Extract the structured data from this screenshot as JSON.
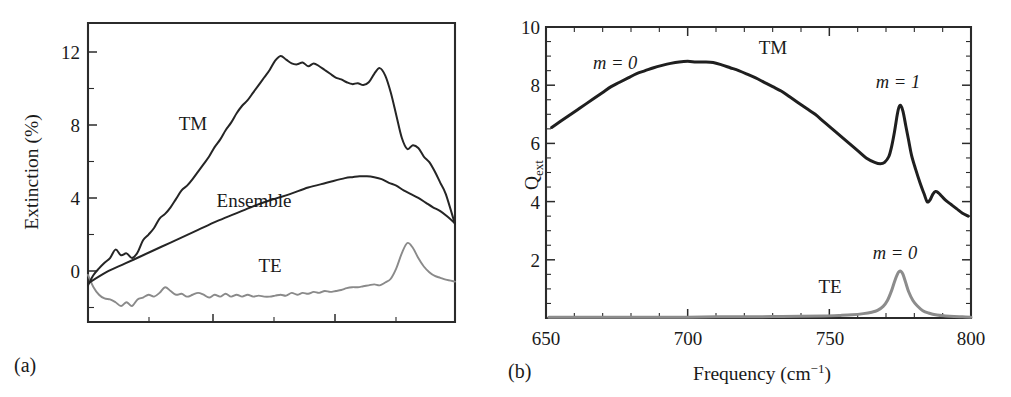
{
  "figure": {
    "background": "#ffffff",
    "panel_tags": [
      "(a)",
      "(b)"
    ]
  },
  "chart_data": [
    {
      "type": "line",
      "panel": "(a)",
      "title": "",
      "xlabel": "",
      "ylabel": "Extinction (%)",
      "xlim": [
        0,
        100
      ],
      "ylim": [
        -2.4,
        13.5
      ],
      "yticks": [
        0,
        4,
        8,
        12
      ],
      "ytick_minor": [
        2,
        6,
        10
      ],
      "xticks_unlabeled": [
        34,
        68
      ],
      "grid": false,
      "legend": "inline-annotations",
      "annotations": [
        {
          "text": "TM",
          "x": 26,
          "y": 7.6
        },
        {
          "text": "Ensemble",
          "x": 37,
          "y": 4.0
        },
        {
          "text": "TE",
          "x": 53,
          "y": 0.35
        }
      ],
      "series": [
        {
          "name": "TM",
          "color": "#252525",
          "x": [
            0,
            1.5,
            3,
            4.5,
            6,
            7.5,
            9,
            10.5,
            12,
            13.5,
            15,
            16.5,
            18,
            19.5,
            21,
            22.5,
            24,
            25.5,
            27,
            28.5,
            30,
            31.5,
            33,
            34.5,
            36,
            37.5,
            39,
            40.5,
            42,
            43.5,
            45,
            46.5,
            48,
            49.5,
            51,
            52.5,
            54,
            55.5,
            57,
            58.5,
            60,
            61.5,
            63,
            64.5,
            66,
            67.5,
            69,
            70.5,
            72,
            73.5,
            75,
            76.5,
            78,
            79.5,
            81,
            82.5,
            84,
            85.5,
            87,
            88.5,
            90,
            91.5,
            93,
            94.5,
            96,
            97.5,
            100
          ],
          "y": [
            -0.45,
            0.1,
            0.45,
            0.75,
            1.0,
            1.45,
            1.15,
            1.25,
            1.0,
            1.3,
            1.95,
            2.25,
            2.6,
            3.1,
            3.35,
            3.7,
            4.15,
            4.6,
            4.85,
            5.2,
            5.6,
            6.0,
            6.4,
            6.9,
            7.3,
            7.8,
            8.2,
            8.7,
            9.1,
            9.4,
            9.8,
            10.2,
            10.6,
            11.0,
            11.5,
            11.75,
            11.55,
            11.35,
            11.3,
            11.4,
            11.2,
            11.35,
            11.2,
            11.0,
            10.8,
            10.6,
            10.5,
            10.35,
            10.25,
            10.3,
            10.2,
            10.35,
            10.8,
            11.1,
            10.7,
            9.8,
            8.6,
            7.4,
            6.8,
            7.0,
            6.85,
            6.4,
            6.1,
            5.6,
            5.0,
            4.4,
            2.8
          ]
        },
        {
          "name": "Ensemble",
          "color": "#1f1f1f",
          "x": [
            0,
            5,
            10,
            15,
            20,
            25,
            30,
            35,
            40,
            45,
            50,
            55,
            60,
            65,
            70,
            72,
            74,
            76,
            78,
            80,
            82,
            84,
            86,
            88,
            90,
            92,
            94,
            96,
            98,
            100
          ],
          "y": [
            -0.35,
            0.25,
            0.7,
            1.15,
            1.6,
            2.05,
            2.5,
            2.95,
            3.35,
            3.75,
            4.1,
            4.4,
            4.75,
            5.0,
            5.25,
            5.3,
            5.35,
            5.35,
            5.3,
            5.2,
            5.0,
            4.85,
            4.6,
            4.4,
            4.2,
            3.95,
            3.7,
            3.5,
            3.2,
            2.85
          ]
        },
        {
          "name": "TE",
          "color": "#8a8a8a",
          "x": [
            0,
            1.5,
            3,
            4.5,
            6,
            7.5,
            9,
            10.5,
            12,
            13.5,
            15,
            16.5,
            18,
            19.5,
            21,
            22.5,
            24,
            25.5,
            27,
            28.5,
            30,
            31.5,
            33,
            34.5,
            36,
            37.5,
            39,
            40.5,
            42,
            43.5,
            45,
            46.5,
            48,
            49.5,
            51,
            52.5,
            54,
            55.5,
            57,
            58.5,
            60,
            61.5,
            63,
            64.5,
            66,
            67.5,
            69,
            70.5,
            72,
            73.5,
            75,
            76.5,
            78,
            79.5,
            81,
            82.5,
            84,
            85.5,
            87,
            88.5,
            90,
            91.5,
            93,
            94.5,
            96,
            97.5,
            100
          ],
          "y": [
            0.1,
            -0.55,
            -0.95,
            -1.15,
            -1.2,
            -1.35,
            -1.55,
            -1.35,
            -1.55,
            -1.2,
            -1.1,
            -0.95,
            -1.05,
            -0.85,
            -0.55,
            -0.75,
            -0.95,
            -0.9,
            -1.05,
            -0.95,
            -0.85,
            -0.95,
            -1.1,
            -0.95,
            -1.05,
            -0.9,
            -1.05,
            -0.95,
            -1.05,
            -0.95,
            -1.05,
            -1.0,
            -1.05,
            -1.05,
            -1.0,
            -0.95,
            -1.0,
            -0.85,
            -0.95,
            -0.85,
            -0.9,
            -0.8,
            -0.85,
            -0.75,
            -0.8,
            -0.75,
            -0.7,
            -0.6,
            -0.55,
            -0.55,
            -0.5,
            -0.45,
            -0.4,
            -0.45,
            -0.3,
            -0.1,
            0.45,
            1.25,
            1.8,
            1.55,
            1.0,
            0.55,
            0.25,
            0.05,
            -0.05,
            -0.15,
            -0.25
          ]
        }
      ]
    },
    {
      "type": "line",
      "panel": "(b)",
      "title": "",
      "xlabel": "Frequency (cm⁻¹)",
      "ylabel": "Q_ext",
      "ylabel_base": "Q",
      "ylabel_sub": "ext",
      "xlim": [
        650,
        800
      ],
      "ylim": [
        0,
        10
      ],
      "xticks": [
        650,
        700,
        750,
        800
      ],
      "xtick_labels": [
        "650",
        "700",
        "750",
        "800"
      ],
      "xtick_minor_step": 10,
      "yticks": [
        2,
        4,
        6,
        8,
        10
      ],
      "ytick_minor_step": 0.5,
      "grid": false,
      "legend": "inline-annotations",
      "annotations": [
        {
          "text": "m = 0",
          "x": 664,
          "y": 8.55,
          "series": "TM"
        },
        {
          "text": "TM",
          "x": 728,
          "y": 9.1,
          "series": "TM"
        },
        {
          "text": "m = 1",
          "x": 780,
          "y": 7.95,
          "series": "TM"
        },
        {
          "text": "m = 0",
          "x": 779,
          "y": 2.2,
          "series": "TE"
        },
        {
          "text": "TE",
          "x": 756,
          "y": 0.95,
          "series": "TE"
        }
      ],
      "series": [
        {
          "name": "TM",
          "color": "#1f1f1f",
          "x": [
            652,
            655,
            658,
            661,
            664,
            667,
            670,
            673,
            676,
            679,
            682,
            685,
            688,
            691,
            694,
            697,
            700,
            703,
            706,
            709,
            712,
            715,
            718,
            721,
            724,
            727,
            730,
            733,
            736,
            739,
            742,
            745,
            748,
            751,
            754,
            757,
            760,
            763,
            766,
            768,
            769.5,
            771,
            772,
            773,
            774,
            774.6,
            775.2,
            776,
            777,
            778,
            779,
            780.5,
            782,
            783.5,
            784.5,
            785.5,
            786.5,
            787.5,
            788.5,
            789.5,
            791,
            793,
            795,
            797,
            799
          ],
          "y": [
            6.55,
            6.75,
            6.95,
            7.15,
            7.35,
            7.55,
            7.75,
            7.95,
            8.1,
            8.25,
            8.4,
            8.5,
            8.6,
            8.68,
            8.75,
            8.8,
            8.82,
            8.8,
            8.8,
            8.78,
            8.7,
            8.6,
            8.5,
            8.38,
            8.25,
            8.1,
            7.95,
            7.8,
            7.6,
            7.4,
            7.2,
            7.0,
            6.75,
            6.5,
            6.25,
            6.0,
            5.75,
            5.5,
            5.35,
            5.3,
            5.35,
            5.55,
            5.9,
            6.4,
            7.0,
            7.25,
            7.3,
            7.1,
            6.6,
            6.1,
            5.6,
            5.1,
            4.65,
            4.25,
            4.0,
            4.05,
            4.25,
            4.35,
            4.3,
            4.2,
            4.05,
            3.9,
            3.75,
            3.6,
            3.5
          ]
        },
        {
          "name": "TE",
          "color": "#8c8c8c",
          "x": [
            651,
            660,
            670,
            680,
            690,
            700,
            710,
            720,
            730,
            740,
            748,
            754,
            758,
            762,
            765,
            767,
            769,
            770.5,
            772,
            773,
            774,
            774.7,
            775.3,
            776,
            777,
            778,
            779.5,
            781,
            783,
            785,
            788,
            791,
            794,
            797,
            800
          ],
          "y": [
            0.03,
            0.03,
            0.03,
            0.03,
            0.03,
            0.03,
            0.04,
            0.04,
            0.05,
            0.06,
            0.07,
            0.09,
            0.11,
            0.15,
            0.2,
            0.26,
            0.4,
            0.6,
            0.95,
            1.25,
            1.5,
            1.6,
            1.6,
            1.5,
            1.2,
            0.9,
            0.6,
            0.42,
            0.25,
            0.17,
            0.1,
            0.07,
            0.05,
            0.04,
            0.03
          ]
        }
      ]
    }
  ],
  "panel_a": {
    "tag": "(a)",
    "ylabel": "Extinction (%)",
    "ytick_labels": [
      "12",
      "8",
      "4",
      "0"
    ],
    "curve_labels": [
      "TM",
      "Ensemble",
      "TE"
    ]
  },
  "panel_b": {
    "tag": "(b)",
    "ylabel_base": "Q",
    "ylabel_sub": "ext",
    "xlabel_main": "Frequency (cm",
    "xlabel_sup": "−1",
    "xlabel_close": ")",
    "ytick_labels": [
      "10",
      "8",
      "6",
      "4",
      "2"
    ],
    "xtick_labels": [
      "650",
      "700",
      "750",
      "800"
    ],
    "annotation_m0_tm": "m = 0",
    "annotation_tm": "TM",
    "annotation_m1": "m = 1",
    "annotation_m0_te": "m = 0",
    "annotation_te": "TE"
  }
}
